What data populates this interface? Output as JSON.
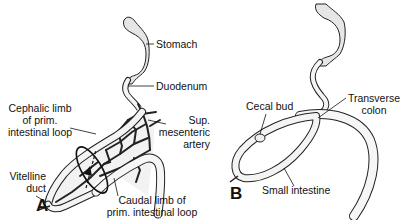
{
  "figure": {
    "panels": [
      {
        "letter": "A",
        "labels": {
          "stomach": "Stomach",
          "duodenum": "Duodenum",
          "cephalic_limb_1": "Cephalic limb",
          "cephalic_limb_2": "of prim.",
          "cephalic_limb_3": "intestinal loop",
          "sup_mes_1": "Sup.",
          "sup_mes_2": "mesenteric",
          "sup_mes_3": "artery",
          "vitelline_1": "Vitelline",
          "vitelline_2": "duct",
          "caudal_1": "Caudal limb of",
          "caudal_2": "prim. intestinal loop"
        }
      },
      {
        "letter": "B",
        "labels": {
          "cecal_bud": "Cecal bud",
          "transverse_1": "Transverse",
          "transverse_2": "colon",
          "small_intestine": "Small intestine"
        }
      }
    ]
  }
}
